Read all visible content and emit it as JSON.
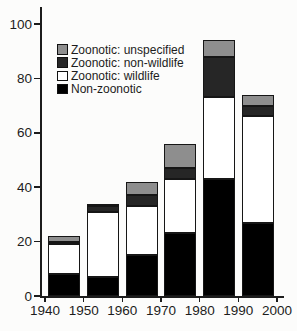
{
  "figure": {
    "background_color": "#fcfcfb",
    "axis_color": "#1c1c1c",
    "bar_outline_color": "#161616"
  },
  "chart_data": {
    "type": "bar",
    "stacked": true,
    "title": "",
    "xlabel": "",
    "ylabel": "",
    "categories": [
      "1940s",
      "1950s",
      "1960s",
      "1970s",
      "1980s",
      "1990s"
    ],
    "series": [
      {
        "name": "Non-zoonotic",
        "color": "#000000",
        "values": [
          8,
          7,
          15,
          23,
          43,
          27
        ]
      },
      {
        "name": "Zoonotic: wildlife",
        "color": "#ffffff",
        "values": [
          11,
          24,
          18,
          20,
          30,
          39
        ]
      },
      {
        "name": "Zoonotic: non-wildlife",
        "color": "#262626",
        "values": [
          1,
          2,
          4,
          4,
          15,
          4
        ]
      },
      {
        "name": "Zoonotic: unspecified",
        "color": "#8e8e8e",
        "values": [
          2,
          1,
          5,
          9,
          6,
          4
        ]
      }
    ],
    "totals": [
      22,
      34,
      42,
      56,
      94,
      74
    ],
    "ylim": [
      0,
      100
    ],
    "y_tick_labels": [
      "0",
      "20",
      "40",
      "60",
      "80",
      "100"
    ],
    "x_tick_labels": [
      "1940",
      "1950",
      "1960",
      "1970",
      "1980",
      "1990",
      "2000"
    ],
    "grid": false,
    "legend": {
      "position": "top-left-inside",
      "items": [
        {
          "label": "Zoonotic: unspecified",
          "color": "#8e8e8e"
        },
        {
          "label": "Zoonotic: non-wildlife",
          "color": "#262626"
        },
        {
          "label": "Zoonotic: wildlife",
          "color": "#ffffff"
        },
        {
          "label": "Non-zoonotic",
          "color": "#000000"
        }
      ]
    }
  }
}
